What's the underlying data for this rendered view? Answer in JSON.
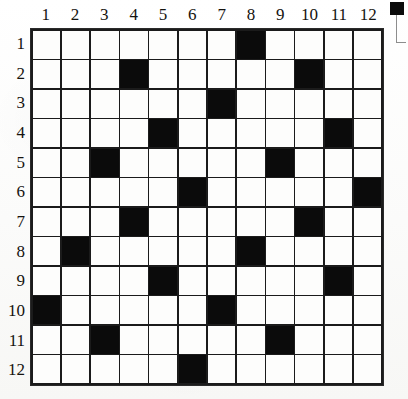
{
  "puzzle": {
    "title": "Numbered 12x12 Grid Puzzle",
    "grid_size": 12,
    "column_headers": [
      "1",
      "2",
      "3",
      "4",
      "5",
      "6",
      "7",
      "8",
      "9",
      "10",
      "11",
      "12"
    ],
    "row_headers": [
      "1",
      "2",
      "3",
      "4",
      "5",
      "6",
      "7",
      "8",
      "9",
      "10",
      "11",
      "12"
    ],
    "colors": {
      "filled_cell": "#0b0b0b",
      "empty_cell": "#fdfdfc",
      "grid_line": "#1b1b1b",
      "label_text": "#15130f",
      "paper": "#fdfdfc"
    },
    "cells": [
      [
        0,
        0,
        0,
        0,
        0,
        0,
        0,
        1,
        0,
        0,
        0,
        0
      ],
      [
        0,
        0,
        0,
        1,
        0,
        0,
        0,
        0,
        0,
        1,
        0,
        0
      ],
      [
        0,
        0,
        0,
        0,
        0,
        0,
        1,
        0,
        0,
        0,
        0,
        0
      ],
      [
        0,
        0,
        0,
        0,
        1,
        0,
        0,
        0,
        0,
        0,
        1,
        0
      ],
      [
        0,
        0,
        1,
        0,
        0,
        0,
        0,
        0,
        1,
        0,
        0,
        0
      ],
      [
        0,
        0,
        0,
        0,
        0,
        1,
        0,
        0,
        0,
        0,
        0,
        1
      ],
      [
        0,
        0,
        0,
        1,
        0,
        0,
        0,
        0,
        0,
        1,
        0,
        0
      ],
      [
        0,
        1,
        0,
        0,
        0,
        0,
        0,
        1,
        0,
        0,
        0,
        0
      ],
      [
        0,
        0,
        0,
        0,
        1,
        0,
        0,
        0,
        0,
        0,
        1,
        0
      ],
      [
        1,
        0,
        0,
        0,
        0,
        0,
        1,
        0,
        0,
        0,
        0,
        0
      ],
      [
        0,
        0,
        1,
        0,
        0,
        0,
        0,
        0,
        1,
        0,
        0,
        0
      ],
      [
        0,
        0,
        0,
        0,
        0,
        1,
        0,
        0,
        0,
        0,
        0,
        0
      ]
    ],
    "filled_cell_count": 22,
    "filled_coordinates": [
      "r1c8",
      "r2c4",
      "r2c10",
      "r3c7",
      "r4c5",
      "r4c11",
      "r5c3",
      "r5c9",
      "r6c6",
      "r6c12",
      "r7c4",
      "r7c10",
      "r8c2",
      "r8c8",
      "r9c5",
      "r9c11",
      "r10c1",
      "r10c7",
      "r11c3",
      "r11c9",
      "r12c6"
    ]
  },
  "marks": {
    "corner_registration": "black-square-mark",
    "corner_bracket": "crop-bracket"
  }
}
